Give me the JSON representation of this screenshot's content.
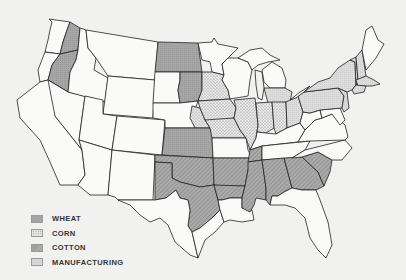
{
  "legend": {
    "items": [
      {
        "label": "WHEAT",
        "pattern": "solid-dark-stipple",
        "color": "#a4a4a4"
      },
      {
        "label": "CORN",
        "pattern": "dotted-light",
        "color": "#e4e4e4"
      },
      {
        "label": "COTTON",
        "pattern": "diagonal-hatch",
        "color": "#a8a8a8"
      },
      {
        "label": "MANUFACTURING",
        "pattern": "light-fine-grid",
        "color": "#d6d6d6"
      }
    ]
  },
  "regions": {
    "wheat": [
      "Washington (east)",
      "Oregon (east)",
      "North Dakota",
      "South Dakota (east)",
      "Kansas"
    ],
    "corn": [
      "Minnesota (south)",
      "Nebraska (east)",
      "Iowa",
      "Missouri (north)",
      "Illinois",
      "Indiana",
      "Ohio (west)"
    ],
    "cotton": [
      "Oklahoma",
      "Texas (east)",
      "Arkansas",
      "Louisiana (north)",
      "Mississippi",
      "Alabama",
      "Georgia",
      "South Carolina",
      "Tennessee (west)"
    ],
    "manufacturing": [
      "Michigan (south)",
      "Ohio (east)",
      "Pennsylvania",
      "New York",
      "New Jersey",
      "New England"
    ]
  },
  "colors": {
    "background": "#f1f1ef",
    "border": "#222222",
    "wheat": "#a4a4a4",
    "corn": "#e6e6e6",
    "cotton": "#a8a8a8",
    "manufacturing": "#d8d8d8"
  }
}
